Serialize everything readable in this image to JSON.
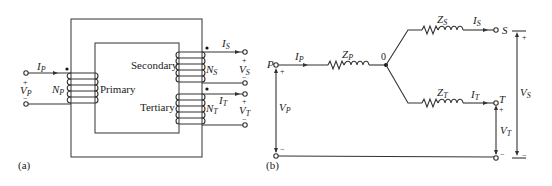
{
  "figure": {
    "panel_a": {
      "label": "(a)",
      "core_label_primary": "Primary",
      "core_label_secondary": "Secondary",
      "core_label_tertiary": "Tertiary",
      "primary": {
        "current": "I",
        "current_sub": "P",
        "voltage": "V",
        "voltage_sub": "P",
        "turns": "N",
        "turns_sub": "P",
        "plus": "+",
        "minus": "−"
      },
      "secondary": {
        "current": "I",
        "current_sub": "S",
        "voltage": "V",
        "voltage_sub": "S",
        "turns": "N",
        "turns_sub": "S",
        "plus": "+",
        "minus": "−"
      },
      "tertiary": {
        "current": "I",
        "current_sub": "T",
        "voltage": "V",
        "voltage_sub": "T",
        "turns": "N",
        "turns_sub": "T",
        "plus": "+",
        "minus": "−"
      }
    },
    "panel_b": {
      "label": "(b)",
      "node_p": "P",
      "node_s": "S",
      "node_t": "T",
      "node_0": "0",
      "ip": {
        "main": "I",
        "sub": "P"
      },
      "is": {
        "main": "I",
        "sub": "S"
      },
      "it": {
        "main": "I",
        "sub": "T"
      },
      "zp": {
        "main": "Z",
        "sub": "P"
      },
      "zs": {
        "main": "Z",
        "sub": "S"
      },
      "zt": {
        "main": "Z",
        "sub": "T"
      },
      "vp": {
        "main": "V",
        "sub": "P"
      },
      "vs": {
        "main": "V",
        "sub": "S"
      },
      "vt": {
        "main": "V",
        "sub": "T"
      },
      "plus": "+",
      "minus": "−"
    }
  }
}
